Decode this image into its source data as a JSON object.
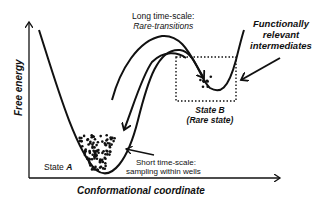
{
  "diagram": {
    "type": "free-energy-landscape",
    "axes": {
      "y_label": "Free energy",
      "x_label": "Conformational coordinate"
    },
    "states": [
      {
        "id": "A",
        "label_prefix": "State ",
        "label_name": "A",
        "kind": "deep well"
      },
      {
        "id": "B",
        "label_line1": "State B",
        "label_line2": "(Rare state)",
        "kind": "shallow well"
      }
    ],
    "annotations": {
      "long_timescale_line1": "Long time-scale:",
      "long_timescale_line2": "Rare-transitions",
      "short_timescale_line1": "Short time-scale:",
      "short_timescale_line2": "sampling within wells",
      "intermediates_line1": "Functionally",
      "intermediates_line2": "relevant",
      "intermediates_line3": "intermediates"
    },
    "colors": {
      "ink": "#111111",
      "background": "#ffffff"
    }
  }
}
